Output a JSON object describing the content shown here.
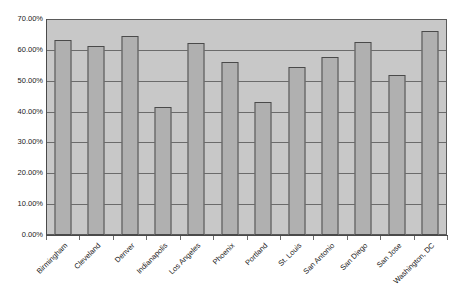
{
  "chart_data": {
    "type": "bar",
    "title": "",
    "xlabel": "",
    "ylabel": "",
    "ylim": [
      0,
      0.7
    ],
    "grid": true,
    "legend": false,
    "y_tick_labels": [
      "70.00%",
      "60.00%",
      "50.00%",
      "40.00%",
      "30.00%",
      "20.00%",
      "10.00%",
      "0.00%"
    ],
    "y_tick_values": [
      0.7,
      0.6,
      0.5,
      0.4,
      0.3,
      0.2,
      0.1,
      0.0
    ],
    "categories": [
      "Birmingham",
      "Cleveland",
      "Denver",
      "Indianapolis",
      "Los Angeles",
      "Phoenix",
      "Portland",
      "St. Louis",
      "San Antonio",
      "San Diego",
      "San Jose",
      "Washington, DC"
    ],
    "values": [
      0.633,
      0.611,
      0.645,
      0.415,
      0.622,
      0.561,
      0.432,
      0.545,
      0.577,
      0.627,
      0.52,
      0.66
    ],
    "value_labels": [
      "63.30%",
      "61.10%",
      "64.50%",
      "41.50%",
      "62.20%",
      "56.10%",
      "43.20%",
      "54.50%",
      "57.70%",
      "62.70%",
      "52.00%",
      "66.00%"
    ],
    "colors": {
      "bar_fill": "#b0b0b0",
      "bar_border": "#4a4a4a",
      "plot_background": "#c8c8c8",
      "gridline": "#6b6b6b",
      "axis": "#4a4a4a",
      "page_background": "#ffffff",
      "text": "#1a1a1a"
    }
  }
}
